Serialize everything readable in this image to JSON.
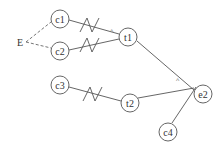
{
  "diagram": {
    "type": "graph",
    "source_label": "E",
    "nodes": [
      {
        "id": "c1",
        "label": "c1",
        "x": 60,
        "y": 19
      },
      {
        "id": "c2",
        "label": "c2",
        "x": 60,
        "y": 51
      },
      {
        "id": "t1",
        "label": "t1",
        "x": 128,
        "y": 37
      },
      {
        "id": "e2",
        "label": "e2",
        "x": 203,
        "y": 94
      },
      {
        "id": "c3",
        "label": "c3",
        "x": 60,
        "y": 85
      },
      {
        "id": "t2",
        "label": "t2",
        "x": 130,
        "y": 103
      },
      {
        "id": "c4",
        "label": "c4",
        "x": 168,
        "y": 132
      }
    ],
    "edges": [
      {
        "from": "E",
        "to": "c1",
        "style": "dashed"
      },
      {
        "from": "E",
        "to": "c2",
        "style": "dashed"
      },
      {
        "from": "c1",
        "to": "t1",
        "style": "solid",
        "marker": "wave"
      },
      {
        "from": "c2",
        "to": "t1",
        "style": "solid",
        "marker": "wave"
      },
      {
        "from": "c3",
        "to": "t2",
        "style": "solid",
        "marker": "wave"
      },
      {
        "from": "t1",
        "to": "e2",
        "style": "solid"
      },
      {
        "from": "t2",
        "to": "e2",
        "style": "solid"
      },
      {
        "from": "c4",
        "to": "e2",
        "style": "solid"
      }
    ],
    "junction_markers": [
      "^",
      "^"
    ]
  }
}
